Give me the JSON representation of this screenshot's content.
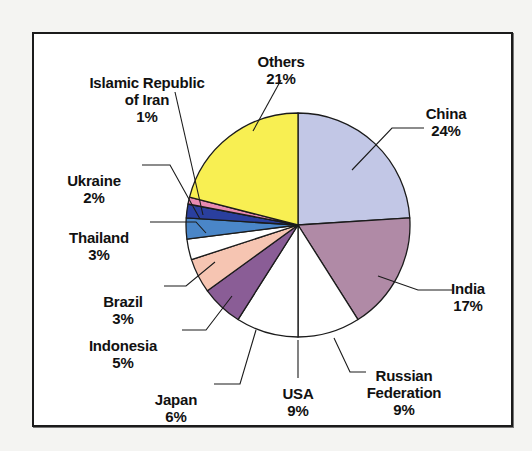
{
  "chart_data": {
    "type": "pie",
    "title": "",
    "subtitle": "",
    "xlabel": "",
    "ylabel": "",
    "legend_position": "none",
    "grid": false,
    "units": "percent",
    "start_angle_deg": 0,
    "direction": "clockwise",
    "categories": [
      "China",
      "India",
      "Russian Federation",
      "USA",
      "Japan",
      "Indonesia",
      "Brazil",
      "Thailand",
      "Ukraine",
      "Islamic Republic of Iran",
      "Others"
    ],
    "values": [
      24,
      17,
      9,
      9,
      6,
      5,
      3,
      3,
      2,
      1,
      21
    ],
    "value_labels": [
      "24%",
      "17%",
      "9%",
      "9%",
      "6%",
      "5%",
      "3%",
      "3%",
      "2%",
      "1%",
      "21%"
    ],
    "colors": [
      "#c2c7e6",
      "#b08aa6",
      "#ffffff",
      "#ffffff",
      "#8a5d96",
      "#8a5d96",
      "#f6c5b2",
      "#4a86c8",
      "#ffffff",
      "#2a3f9e",
      "#f8ef52"
    ],
    "slices": [
      {
        "label": "China",
        "value": 24,
        "value_label": "24%",
        "color": "#c2c7e6"
      },
      {
        "label": "India",
        "value": 17,
        "value_label": "17%",
        "color": "#b08aa6"
      },
      {
        "label": "Russian Federation",
        "value": 9,
        "value_label": "9%",
        "color": "#ffffff"
      },
      {
        "label": "USA",
        "value": 9,
        "value_label": "9%",
        "color": "#ffffff"
      },
      {
        "label": "Japan",
        "value": 6,
        "value_label": "6%",
        "color": "#8a5d96"
      },
      {
        "label": "Indonesia",
        "value": 5,
        "value_label": "5%",
        "color": "#f6c5b2"
      },
      {
        "label": "Brazil",
        "value": 3,
        "value_label": "3%",
        "color": "#ffffff"
      },
      {
        "label": "Thailand",
        "value": 3,
        "value_label": "3%",
        "color": "#4a86c8"
      },
      {
        "label": "Ukraine",
        "value": 2,
        "value_label": "2%",
        "color": "#2a3f9e"
      },
      {
        "label": "Islamic Republic of Iran",
        "value": 1,
        "value_label": "1%",
        "color": "#e88ab0"
      },
      {
        "label": "Others",
        "value": 21,
        "value_label": "21%",
        "color": "#f8ef52"
      }
    ]
  },
  "labels": {
    "china": {
      "name": "China",
      "pct": "24%"
    },
    "india": {
      "name": "India",
      "pct": "17%"
    },
    "russia": {
      "name": "Russian\nFederation",
      "pct": "9%"
    },
    "usa": {
      "name": "USA",
      "pct": "9%"
    },
    "japan": {
      "name": "Japan",
      "pct": "6%"
    },
    "indonesia": {
      "name": "Indonesia",
      "pct": "5%"
    },
    "brazil": {
      "name": "Brazil",
      "pct": "3%"
    },
    "thailand": {
      "name": "Thailand",
      "pct": "3%"
    },
    "ukraine": {
      "name": "Ukraine",
      "pct": "2%"
    },
    "iran": {
      "name": "Islamic Republic\nof Iran",
      "pct": "1%"
    },
    "others": {
      "name": "Others",
      "pct": "21%"
    }
  },
  "style": {
    "outline_color": "#1b1b1b",
    "frame_color": "#1b1b1b",
    "background": "#ffffff"
  }
}
